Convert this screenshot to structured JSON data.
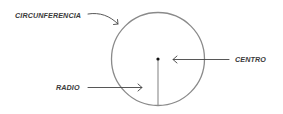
{
  "diagram": {
    "labels": {
      "circumference": "CIRCUNFERENCIA",
      "center": "CENTRO",
      "radius": "RADIO"
    },
    "colors": {
      "circle": "#8a8a8a",
      "radius_line": "#8a8a8a",
      "arrows": "#444444",
      "center_dot": "#111111",
      "text": "#3a3a3a",
      "background": "#ffffff"
    },
    "geometry": {
      "center_x": 158,
      "center_y": 59,
      "radius": 47
    }
  }
}
